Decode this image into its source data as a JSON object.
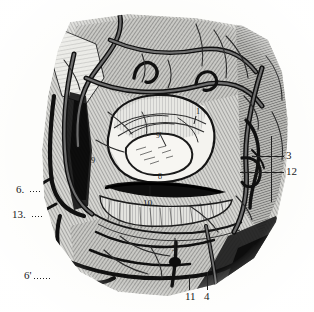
{
  "figure": {
    "kind": "anatomical-engraving",
    "style": "steel engraving, monochrome hatching",
    "background_color": "#fdfdfb",
    "ink_color": "#1a1a1a",
    "mid_tone_color": "#8e8e8e",
    "shadow_color": "#2b2b2b"
  },
  "labels": {
    "l1": {
      "text": "1"
    },
    "l3": {
      "text": "3"
    },
    "l4": {
      "text": "4"
    },
    "l5": {
      "text": "5"
    },
    "l6": {
      "text": "6."
    },
    "l6p": {
      "text": "6'"
    },
    "l8": {
      "text": "8"
    },
    "l9": {
      "text": "9"
    },
    "l9p": {
      "text": "9'"
    },
    "l10": {
      "text": "10"
    },
    "l11": {
      "text": "11"
    },
    "l12": {
      "text": "12"
    },
    "l13": {
      "text": "13."
    }
  }
}
